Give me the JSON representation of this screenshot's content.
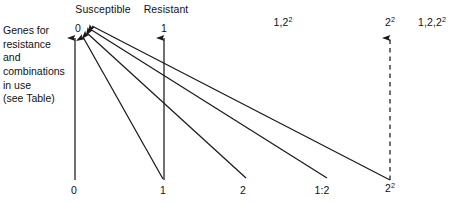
{
  "diagram": {
    "title_top_left_note": {
      "lines": [
        "Genes for",
        "resistance",
        "and",
        "combinations",
        "in use",
        "(see Table)"
      ]
    },
    "column_headers": [
      {
        "id": "susceptible",
        "label": "Susceptible",
        "x": 103
      },
      {
        "id": "resistant",
        "label": "Resistant",
        "x": 166
      }
    ],
    "top_node_labels": [
      {
        "id": "top-0",
        "text": "0",
        "sup": "",
        "x": 78
      },
      {
        "id": "top-1",
        "text": "1",
        "sup": "",
        "x": 164
      },
      {
        "id": "top-1-2sq",
        "text": "1,2",
        "sup": "2",
        "x": 283
      },
      {
        "id": "top-2sq",
        "text": "2",
        "sup": "2",
        "x": 390
      },
      {
        "id": "top-1-2-2sq",
        "text": "1,2,2",
        "sup": "2",
        "x": 432
      }
    ],
    "bottom_node_labels": [
      {
        "id": "bottom-0",
        "text": "0",
        "sup": "",
        "x": 74
      },
      {
        "id": "bottom-1",
        "text": "1",
        "sup": "",
        "x": 163
      },
      {
        "id": "bottom-2",
        "text": "2",
        "sup": "",
        "x": 243
      },
      {
        "id": "bottom-1-2",
        "text": "1:2",
        "sup": "",
        "x": 322
      },
      {
        "id": "bottom-2sq",
        "text": "2",
        "sup": "2",
        "x": 390
      }
    ],
    "colors": {
      "stroke": "#1a1a1a",
      "text": "#111111",
      "background": "#ffffff"
    },
    "edges": [
      {
        "id": "edge-0-vertical",
        "from": "bottom-0",
        "to": "top-0",
        "style": "solid",
        "arrow": true
      },
      {
        "id": "edge-1-vertical",
        "from": "bottom-1",
        "to": "top-1",
        "style": "solid",
        "arrow": true
      },
      {
        "id": "edge-2sq-vertical",
        "from": "bottom-2sq",
        "to": "top-2sq",
        "style": "dashed",
        "arrow": true
      },
      {
        "id": "edge-1-to-0",
        "from": "bottom-1",
        "to": "top-0",
        "style": "solid",
        "arrow": true
      },
      {
        "id": "edge-2-to-0",
        "from": "bottom-2",
        "to": "top-0",
        "style": "solid",
        "arrow": true
      },
      {
        "id": "edge-1-2-to-0",
        "from": "bottom-1-2",
        "to": "top-0",
        "style": "solid",
        "arrow": true
      },
      {
        "id": "edge-2sq-to-0",
        "from": "bottom-2sq",
        "to": "top-0",
        "style": "solid",
        "arrow": true
      }
    ]
  }
}
